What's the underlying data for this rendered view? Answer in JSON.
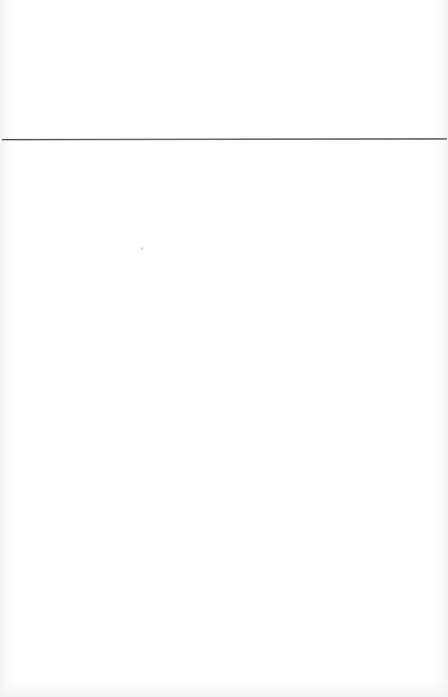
{
  "page": {
    "type": "blank-ruled-card",
    "background_color": "#ffffff",
    "rule_color": "#4a4a4a",
    "header_text": "",
    "body_text": ""
  }
}
